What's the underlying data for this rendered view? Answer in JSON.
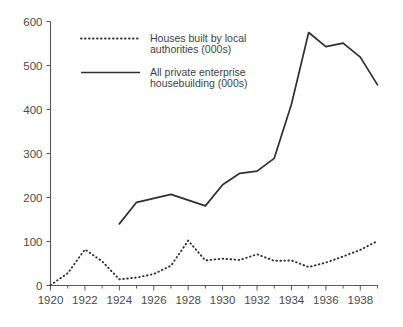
{
  "chart_data": {
    "type": "line",
    "title": "",
    "subtitle": "",
    "xlabel": "",
    "ylabel": "",
    "xlim": [
      1920,
      1939
    ],
    "ylim": [
      0,
      600
    ],
    "grid": false,
    "legend_position": "top-left",
    "x": [
      1920,
      1921,
      1922,
      1923,
      1924,
      1925,
      1926,
      1927,
      1928,
      1929,
      1930,
      1931,
      1932,
      1933,
      1934,
      1935,
      1936,
      1937,
      1938,
      1939
    ],
    "xticks": [
      1920,
      1922,
      1924,
      1926,
      1928,
      1930,
      1932,
      1934,
      1936,
      1938
    ],
    "xticklabels": [
      "1920",
      "1922",
      "1924",
      "1926",
      "1928",
      "1930",
      "1932",
      "1934",
      "1936",
      "1938"
    ],
    "xticks_minor": [
      1921,
      1923,
      1925,
      1927,
      1929,
      1931,
      1933,
      1935,
      1937,
      1939
    ],
    "yticks": [
      0,
      100,
      200,
      300,
      400,
      500,
      600
    ],
    "yticklabels": [
      "0",
      "100",
      "200",
      "300",
      "400",
      "500",
      "600"
    ],
    "series": [
      {
        "name": "Houses built by local authorities (000s)",
        "style": "dotted",
        "color": "#2f2f2f",
        "x": [
          1920,
          1921,
          1922,
          1923,
          1924,
          1925,
          1926,
          1927,
          1928,
          1929,
          1930,
          1931,
          1932,
          1933,
          1934,
          1935,
          1936,
          1937,
          1938,
          1939
        ],
        "values": [
          1,
          28,
          82,
          55,
          14,
          18,
          26,
          45,
          102,
          57,
          61,
          58,
          71,
          56,
          57,
          42,
          52,
          66,
          81,
          101
        ]
      },
      {
        "name": "All private enterprise housebuilding (000s)",
        "style": "solid",
        "color": "#2f2f2f",
        "x": [
          1924,
          1925,
          1926,
          1927,
          1928,
          1929,
          1930,
          1931,
          1932,
          1933,
          1934,
          1935,
          1936,
          1937,
          1938,
          1939
        ],
        "values": [
          140,
          189,
          198,
          207,
          194,
          181,
          229,
          255,
          260,
          289,
          412,
          575,
          543,
          551,
          519,
          456
        ]
      }
    ]
  },
  "legend": {
    "items": [
      {
        "label_line1": "Houses built by local",
        "label_line2": "authorities (000s)",
        "style": "dotted"
      },
      {
        "label_line1": "All private enterprise",
        "label_line2": "housebuilding (000s)",
        "style": "solid"
      }
    ]
  },
  "axes": {
    "y": {
      "labels": [
        "600",
        "500",
        "400",
        "300",
        "200",
        "100",
        "0"
      ]
    },
    "x": {
      "labels": [
        "1920",
        "1922",
        "1924",
        "1926",
        "1928",
        "1930",
        "1932",
        "1934",
        "1936",
        "1938"
      ]
    }
  }
}
